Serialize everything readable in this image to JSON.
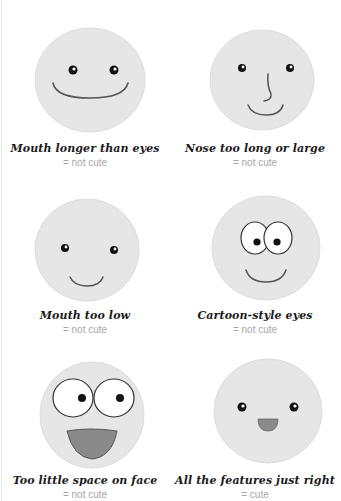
{
  "colors": {
    "face_fill": "#e6e6e6",
    "face_stroke": "#dcdcdc",
    "line": "#555555",
    "mouth_fill": "#8a8a8a",
    "caption": "#1a1a1a",
    "verdict": "#a8a8a8"
  },
  "panels": [
    {
      "title": "Mouth longer than eyes",
      "verdict": "= not cute"
    },
    {
      "title": "Nose too long or large",
      "verdict": "= not cute"
    },
    {
      "title": "Mouth too low",
      "verdict": "= not cute"
    },
    {
      "title": "Cartoon-style eyes",
      "verdict": "= not cute"
    },
    {
      "title": "Too little space on face",
      "verdict": "= not cute"
    },
    {
      "title": "All the features just right",
      "verdict": "= cute"
    }
  ]
}
